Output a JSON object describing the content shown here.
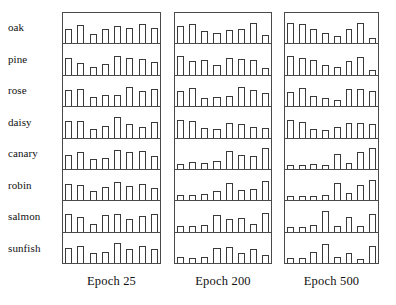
{
  "figure": {
    "row_labels": [
      "oak",
      "pine",
      "rose",
      "daisy",
      "canary",
      "robin",
      "salmon",
      "sunfish"
    ],
    "column_captions": [
      "Epoch 25",
      "Epoch 200",
      "Epoch 500"
    ],
    "bar_color": "#ffffff",
    "bar_outline_color": "#3a3a3a",
    "panel_border_color": "#4a4a4a",
    "background_color": "#ffffff"
  },
  "chart_data": {
    "type": "bar",
    "title": "",
    "xlabel": "",
    "ylabel": "",
    "ylim": [
      0,
      1
    ],
    "grid": false,
    "legend": "none",
    "categories": [
      "oak",
      "pine",
      "rose",
      "daisy",
      "canary",
      "robin",
      "salmon",
      "sunfish"
    ],
    "columns": [
      "Epoch 25",
      "Epoch 200",
      "Epoch 500"
    ],
    "bars_per_cell": 8,
    "series": [
      {
        "name": "Epoch 25",
        "rows": [
          {
            "name": "oak",
            "values": [
              0.6,
              0.78,
              0.38,
              0.62,
              0.74,
              0.66,
              0.82,
              0.64
            ]
          },
          {
            "name": "pine",
            "values": [
              0.72,
              0.5,
              0.34,
              0.44,
              0.8,
              0.7,
              0.66,
              0.52
            ]
          },
          {
            "name": "rose",
            "values": [
              0.66,
              0.74,
              0.4,
              0.46,
              0.48,
              0.8,
              0.62,
              0.7
            ]
          },
          {
            "name": "daisy",
            "values": [
              0.7,
              0.68,
              0.36,
              0.5,
              0.86,
              0.58,
              0.44,
              0.64
            ]
          },
          {
            "name": "canary",
            "values": [
              0.6,
              0.72,
              0.4,
              0.44,
              0.78,
              0.72,
              0.74,
              0.56
            ]
          },
          {
            "name": "robin",
            "values": [
              0.68,
              0.64,
              0.38,
              0.54,
              0.76,
              0.58,
              0.7,
              0.5
            ]
          },
          {
            "name": "salmon",
            "values": [
              0.74,
              0.62,
              0.3,
              0.68,
              0.72,
              0.54,
              0.66,
              0.76
            ]
          },
          {
            "name": "sunfish",
            "values": [
              0.64,
              0.7,
              0.42,
              0.46,
              0.82,
              0.6,
              0.72,
              0.58
            ]
          }
        ]
      },
      {
        "name": "Epoch 200",
        "rows": [
          {
            "name": "oak",
            "values": [
              0.74,
              0.8,
              0.52,
              0.44,
              0.58,
              0.62,
              0.84,
              0.34
            ]
          },
          {
            "name": "pine",
            "values": [
              0.78,
              0.58,
              0.64,
              0.4,
              0.72,
              0.66,
              0.6,
              0.3
            ]
          },
          {
            "name": "rose",
            "values": [
              0.62,
              0.76,
              0.34,
              0.38,
              0.42,
              0.8,
              0.68,
              0.56
            ]
          },
          {
            "name": "daisy",
            "values": [
              0.74,
              0.7,
              0.38,
              0.34,
              0.62,
              0.58,
              0.46,
              0.4
            ]
          },
          {
            "name": "canary",
            "values": [
              0.22,
              0.28,
              0.26,
              0.34,
              0.76,
              0.6,
              0.52,
              0.86
            ]
          },
          {
            "name": "robin",
            "values": [
              0.24,
              0.22,
              0.26,
              0.4,
              0.72,
              0.44,
              0.46,
              0.8
            ]
          },
          {
            "name": "salmon",
            "values": [
              0.22,
              0.24,
              0.26,
              0.7,
              0.54,
              0.58,
              0.3,
              0.78
            ]
          },
          {
            "name": "sunfish",
            "values": [
              0.24,
              0.22,
              0.26,
              0.64,
              0.68,
              0.44,
              0.6,
              0.32
            ]
          }
        ]
      },
      {
        "name": "Epoch 500",
        "rows": [
          {
            "name": "oak",
            "values": [
              0.84,
              0.8,
              0.62,
              0.44,
              0.3,
              0.62,
              0.84,
              0.22
            ]
          },
          {
            "name": "pine",
            "values": [
              0.8,
              0.7,
              0.6,
              0.4,
              0.34,
              0.58,
              0.76,
              0.18
            ]
          },
          {
            "name": "rose",
            "values": [
              0.58,
              0.78,
              0.44,
              0.34,
              0.26,
              0.7,
              0.72,
              0.62
            ]
          },
          {
            "name": "daisy",
            "values": [
              0.72,
              0.66,
              0.34,
              0.3,
              0.44,
              0.62,
              0.6,
              0.58
            ]
          },
          {
            "name": "canary",
            "values": [
              0.16,
              0.18,
              0.2,
              0.18,
              0.62,
              0.26,
              0.7,
              0.88
            ]
          },
          {
            "name": "robin",
            "values": [
              0.16,
              0.18,
              0.18,
              0.2,
              0.74,
              0.3,
              0.66,
              0.84
            ]
          },
          {
            "name": "salmon",
            "values": [
              0.18,
              0.2,
              0.26,
              0.86,
              0.24,
              0.62,
              0.22,
              0.74
            ]
          },
          {
            "name": "sunfish",
            "values": [
              0.2,
              0.22,
              0.48,
              0.8,
              0.26,
              0.4,
              0.18,
              0.7
            ]
          }
        ]
      }
    ]
  }
}
